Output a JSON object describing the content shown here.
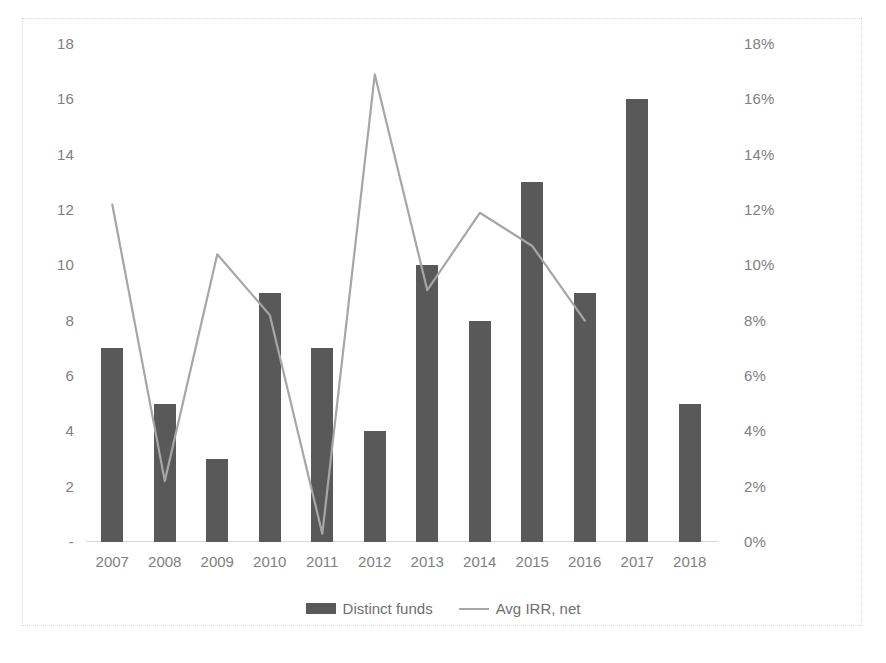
{
  "chart_data": {
    "type": "bar",
    "title": "",
    "subtitle": "",
    "xlabel": "",
    "ylabel": "",
    "categories": [
      "2007",
      "2008",
      "2009",
      "2010",
      "2011",
      "2012",
      "2013",
      "2014",
      "2015",
      "2016",
      "2017",
      "2018"
    ],
    "series": [
      {
        "name": "Distinct funds",
        "type": "bar",
        "axis": "left",
        "color": "#595959",
        "values": [
          7,
          5,
          3,
          9,
          7,
          4,
          10,
          8,
          13,
          9,
          16,
          5
        ]
      },
      {
        "name": "Avg IRR, net",
        "type": "line",
        "axis": "right",
        "color": "#a6a6a6",
        "values": [
          12.2,
          2.2,
          10.4,
          8.2,
          0.3,
          16.9,
          9.1,
          11.9,
          10.7,
          8.0,
          null,
          null
        ]
      }
    ],
    "left_axis": {
      "ticks": [
        "18",
        "16",
        "14",
        "12",
        "10",
        "8",
        "6",
        "4",
        "2",
        "-"
      ],
      "tick_values": [
        18,
        16,
        14,
        12,
        10,
        8,
        6,
        4,
        2,
        0
      ],
      "min": 0,
      "max": 18
    },
    "right_axis": {
      "ticks": [
        "18%",
        "16%",
        "14%",
        "12%",
        "10%",
        "8%",
        "6%",
        "4%",
        "2%",
        "0%"
      ],
      "tick_values": [
        18,
        16,
        14,
        12,
        10,
        8,
        6,
        4,
        2,
        0
      ],
      "min": 0,
      "max": 18
    },
    "grid": false,
    "legend_position": "bottom",
    "legend": [
      "Distinct funds",
      "Avg IRR, net"
    ]
  }
}
